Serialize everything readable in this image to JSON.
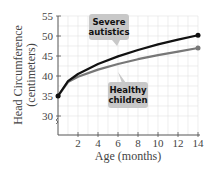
{
  "chart_data": {
    "type": "line",
    "title": "",
    "xlabel": "Age (months)",
    "ylabel": "Head Circumference (centimeters)",
    "ylabel_line1": "Head Circumference",
    "ylabel_line2": "(centimeters)",
    "xlim": [
      0,
      14
    ],
    "ylim": [
      27,
      55
    ],
    "x_ticks": [
      "2",
      "4",
      "6",
      "8",
      "10",
      "12",
      "14"
    ],
    "y_ticks": [
      "30",
      "35",
      "40",
      "45",
      "50",
      "55"
    ],
    "grid": true,
    "y_axis_break": true,
    "series": [
      {
        "name": "Severe autistics",
        "label_line1": "Severe",
        "label_line2": "autistics",
        "color": "#111111",
        "x": [
          0,
          1,
          2,
          4,
          6,
          8,
          10,
          12,
          14
        ],
        "y": [
          35,
          38.7,
          40.5,
          43,
          44.9,
          46.5,
          47.9,
          49.1,
          50.2
        ]
      },
      {
        "name": "Healthy children",
        "label_line1": "Healthy",
        "label_line2": "children",
        "color": "#777777",
        "x": [
          0,
          1,
          2,
          4,
          6,
          8,
          10,
          12,
          14
        ],
        "y": [
          35,
          38.5,
          39.8,
          41.6,
          43,
          44.2,
          45.2,
          46.1,
          47
        ]
      }
    ]
  }
}
